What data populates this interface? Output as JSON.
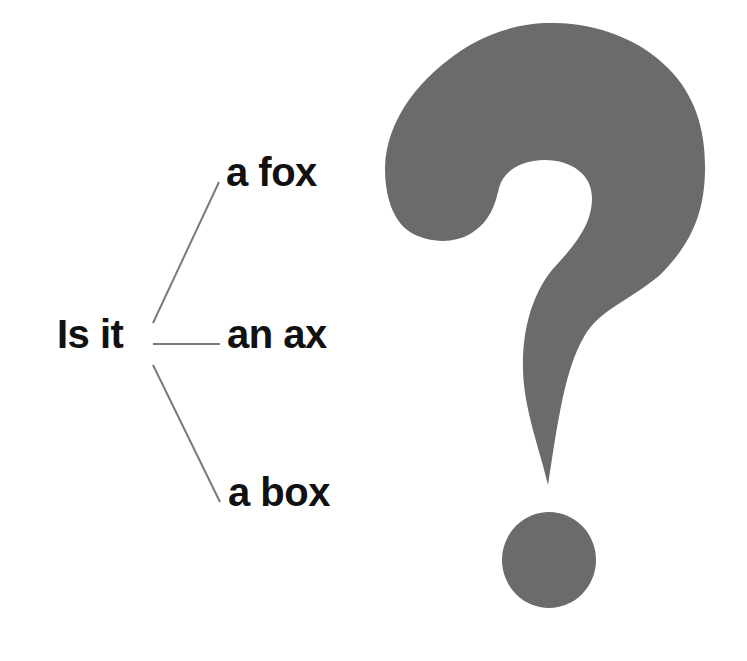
{
  "diagram": {
    "root": {
      "label": "Is it"
    },
    "branches": [
      {
        "label": "a fox"
      },
      {
        "label": "an ax"
      },
      {
        "label": "a box"
      }
    ],
    "symbol": {
      "name": "question-mark",
      "glyph": "?"
    }
  },
  "colors": {
    "text": "#111111",
    "branch_line": "#7a7a7a",
    "question_mark": "#6b6b6b",
    "background": "#ffffff"
  }
}
